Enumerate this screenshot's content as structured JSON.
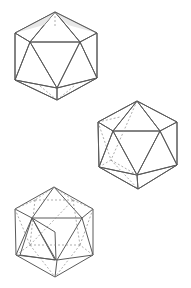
{
  "figure": {
    "background": "#ffffff",
    "colors": {
      "edge": "#5a5a5a",
      "hidden_edge": "#8a8a8a",
      "face_light": "#dcdcdc",
      "face_mid": "#ababab",
      "face_dark": "#8e8e8e",
      "face_darker": "#7a7a7a"
    },
    "drawings": [
      {
        "id": "icosahedron-top",
        "shading": "front belt faces shaded, upper cap light, lower cap white with dashed hidden edges"
      },
      {
        "id": "icosahedron-middle",
        "shading": "central face mid-grey, right faces dark, left side white with dashed hidden edges"
      },
      {
        "id": "icosahedron-bottom",
        "shading": "wireframe with dashed hidden edges, one face pair shaded on left"
      }
    ]
  }
}
